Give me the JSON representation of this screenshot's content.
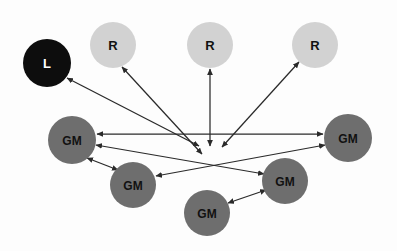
{
  "canvas": {
    "width": 397,
    "height": 251,
    "background_color": "#fdfdfd"
  },
  "palette": {
    "lecturer_fill": "#0d0d0d",
    "lecturer_text": "#ffffff",
    "resource_fill": "#d2d2d2",
    "resource_text": "#111111",
    "group_member_fill": "#6e6e6e",
    "group_member_text": "#111111",
    "edge_color": "#2a2a2a"
  },
  "nodes": [
    {
      "id": "L",
      "label": "L",
      "type": "lecturer",
      "cx": 47,
      "cy": 63,
      "r": 24,
      "fill": "#0d0d0d",
      "text_color": "#ffffff",
      "font_size": 13
    },
    {
      "id": "R1",
      "label": "R",
      "type": "resource",
      "cx": 113,
      "cy": 45,
      "r": 23,
      "fill": "#d2d2d2",
      "text_color": "#111111",
      "font_size": 13
    },
    {
      "id": "R2",
      "label": "R",
      "type": "resource",
      "cx": 210,
      "cy": 45,
      "r": 23,
      "fill": "#d2d2d2",
      "text_color": "#111111",
      "font_size": 13
    },
    {
      "id": "R3",
      "label": "R",
      "type": "resource",
      "cx": 315,
      "cy": 45,
      "r": 23,
      "fill": "#d2d2d2",
      "text_color": "#111111",
      "font_size": 13
    },
    {
      "id": "GM1",
      "label": "GM",
      "type": "group_member",
      "cx": 72,
      "cy": 140,
      "r": 24,
      "fill": "#6e6e6e",
      "text_color": "#111111",
      "font_size": 12
    },
    {
      "id": "GM2",
      "label": "GM",
      "type": "group_member",
      "cx": 133,
      "cy": 185,
      "r": 23,
      "fill": "#6e6e6e",
      "text_color": "#111111",
      "font_size": 12
    },
    {
      "id": "GM3",
      "label": "GM",
      "type": "group_member",
      "cx": 207,
      "cy": 213,
      "r": 23,
      "fill": "#6e6e6e",
      "text_color": "#111111",
      "font_size": 12
    },
    {
      "id": "GM4",
      "label": "GM",
      "type": "group_member",
      "cx": 285,
      "cy": 181,
      "r": 23,
      "fill": "#6e6e6e",
      "text_color": "#111111",
      "font_size": 12
    },
    {
      "id": "GM5",
      "label": "GM",
      "type": "group_member",
      "cx": 348,
      "cy": 138,
      "r": 24,
      "fill": "#6e6e6e",
      "text_color": "#111111",
      "font_size": 12
    }
  ],
  "edges": [
    {
      "id": "e-l-hub",
      "from": "L",
      "to": "hub",
      "x1": 67,
      "y1": 78,
      "x2": 199,
      "y2": 146,
      "arrow_start": true,
      "arrow_end": true
    },
    {
      "id": "e-r1-hub",
      "from": "R1",
      "to": "hub",
      "x1": 122,
      "y1": 67,
      "x2": 202,
      "y2": 154,
      "arrow_start": true,
      "arrow_end": true
    },
    {
      "id": "e-r2-hub",
      "from": "R2",
      "to": "hub",
      "x1": 210,
      "y1": 69,
      "x2": 210,
      "y2": 146,
      "arrow_start": true,
      "arrow_end": true
    },
    {
      "id": "e-r3-hub",
      "from": "R3",
      "to": "hub",
      "x1": 299,
      "y1": 62,
      "x2": 222,
      "y2": 147,
      "arrow_start": true,
      "arrow_end": true
    },
    {
      "id": "e-gm1-gm5",
      "from": "GM1",
      "to": "GM5",
      "x1": 97,
      "y1": 134,
      "x2": 323,
      "y2": 134,
      "arrow_start": true,
      "arrow_end": true
    },
    {
      "id": "e-gm1-gm4",
      "from": "GM1",
      "to": "GM4",
      "x1": 96,
      "y1": 145,
      "x2": 264,
      "y2": 174,
      "arrow_start": true,
      "arrow_end": true
    },
    {
      "id": "e-gm2-gm5",
      "from": "GM2",
      "to": "GM5",
      "x1": 156,
      "y1": 176,
      "x2": 325,
      "y2": 145,
      "arrow_start": true,
      "arrow_end": true
    },
    {
      "id": "e-gm1-gm2",
      "from": "GM1",
      "to": "GM2",
      "x1": 87,
      "y1": 158,
      "x2": 118,
      "y2": 170,
      "arrow_start": true,
      "arrow_end": true
    },
    {
      "id": "e-gm3-gm4",
      "from": "GM3",
      "to": "GM4",
      "x1": 228,
      "y1": 203,
      "x2": 266,
      "y2": 190,
      "arrow_start": true,
      "arrow_end": true
    }
  ],
  "legend": {
    "lecturer": "L",
    "resource": "R",
    "group_member": "GM"
  }
}
